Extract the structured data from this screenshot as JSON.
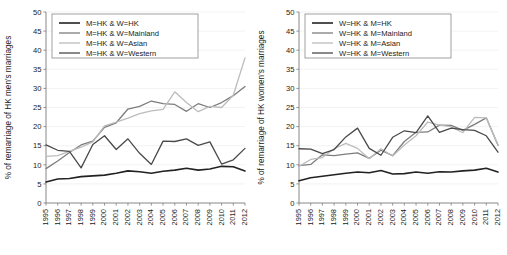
{
  "figure": {
    "background": "#ffffff",
    "panel_count": 2
  },
  "chart_data": [
    {
      "type": "line",
      "title": "",
      "panel": "left",
      "xlabel": "",
      "ylabel": "% of remarriage of HK men's marriages",
      "x": [
        1995,
        1996,
        1997,
        1998,
        1999,
        2000,
        2001,
        2002,
        2003,
        2004,
        2005,
        2006,
        2007,
        2008,
        2009,
        2010,
        2011,
        2012
      ],
      "xlim": [
        1995,
        2012
      ],
      "ylim": [
        0,
        50
      ],
      "yticks": [
        0,
        5,
        10,
        15,
        20,
        25,
        30,
        35,
        40,
        45,
        50
      ],
      "xticks": [
        1995,
        1996,
        1997,
        1998,
        1999,
        2000,
        2001,
        2002,
        2003,
        2004,
        2005,
        2006,
        2007,
        2008,
        2009,
        2010,
        2011,
        2012
      ],
      "grid": true,
      "legend_position": "upper-left",
      "series": [
        {
          "name": "M=HK & W=HK",
          "color": "#222222",
          "width": 1.6,
          "values": [
            5.5,
            6.3,
            6.4,
            6.9,
            7.1,
            7.3,
            7.8,
            8.4,
            8.2,
            7.8,
            8.3,
            8.6,
            9.1,
            8.6,
            8.9,
            9.6,
            9.5,
            8.4
          ]
        },
        {
          "name": "M=HK & W=Mainland",
          "color": "#7d7d7d",
          "width": 1.3,
          "values": [
            9.0,
            11.0,
            13.2,
            15.2,
            16.2,
            19.8,
            21.0,
            24.6,
            25.3,
            26.7,
            26.0,
            25.8,
            24.0,
            26.0,
            25.0,
            26.3,
            28.1,
            30.5
          ]
        },
        {
          "name": "M=HK & W=Asian",
          "color": "#bcbcbc",
          "width": 1.3,
          "values": [
            12.2,
            12.4,
            13.5,
            14.6,
            16.0,
            20.2,
            21.2,
            22.2,
            23.4,
            24.1,
            24.5,
            29.1,
            26.3,
            23.9,
            25.3,
            25.0,
            28.2,
            38.0
          ]
        },
        {
          "name": "M=HK & W=Western",
          "color": "#4a4a4a",
          "width": 1.3,
          "values": [
            15.2,
            13.8,
            13.5,
            9.2,
            15.3,
            17.6,
            14.0,
            16.8,
            13.0,
            10.1,
            16.2,
            16.1,
            16.8,
            15.1,
            16.0,
            10.2,
            11.3,
            14.3
          ]
        }
      ]
    },
    {
      "type": "line",
      "title": "",
      "panel": "right",
      "xlabel": "",
      "ylabel": "% of remarriage of HK women's marriages",
      "x": [
        1995,
        1996,
        1997,
        1998,
        1999,
        2000,
        2001,
        2002,
        2003,
        2004,
        2005,
        2006,
        2007,
        2008,
        2009,
        2010,
        2011,
        2012
      ],
      "xlim": [
        1995,
        2012
      ],
      "ylim": [
        0,
        50
      ],
      "yticks": [
        0,
        5,
        10,
        15,
        20,
        25,
        30,
        35,
        40,
        45,
        50
      ],
      "xticks": [
        1995,
        1996,
        1997,
        1998,
        1999,
        2000,
        2001,
        2002,
        2003,
        2004,
        2005,
        2006,
        2007,
        2008,
        2009,
        2010,
        2011,
        2012
      ],
      "grid": true,
      "legend_position": "upper-left",
      "series": [
        {
          "name": "W=HK & M=HK",
          "color": "#222222",
          "width": 1.6,
          "values": [
            5.8,
            6.6,
            7.0,
            7.4,
            7.8,
            8.1,
            7.9,
            8.5,
            7.6,
            7.7,
            8.1,
            7.8,
            8.2,
            8.1,
            8.4,
            8.6,
            9.1,
            8.1
          ]
        },
        {
          "name": "W=HK & M=Mainland",
          "color": "#7d7d7d",
          "width": 1.3,
          "values": [
            9.8,
            10.1,
            12.6,
            12.4,
            12.8,
            13.1,
            11.7,
            13.8,
            12.4,
            16.1,
            18.5,
            18.6,
            20.4,
            20.3,
            19.0,
            20.6,
            22.3,
            15.1
          ]
        },
        {
          "name": "W=HK & M=Asian",
          "color": "#bcbcbc",
          "width": 1.3,
          "values": [
            9.6,
            11.4,
            11.9,
            14.2,
            15.6,
            14.3,
            11.6,
            14.2,
            12.3,
            15.2,
            17.6,
            21.2,
            20.4,
            20.0,
            18.4,
            22.4,
            22.3,
            15.2
          ]
        },
        {
          "name": "W=HK & M=Western",
          "color": "#4a4a4a",
          "width": 1.3,
          "values": [
            14.2,
            14.1,
            12.9,
            14.0,
            17.3,
            19.6,
            14.3,
            12.5,
            17.2,
            18.9,
            18.4,
            22.8,
            18.5,
            19.6,
            19.2,
            19.0,
            17.6,
            13.3
          ]
        }
      ]
    }
  ]
}
